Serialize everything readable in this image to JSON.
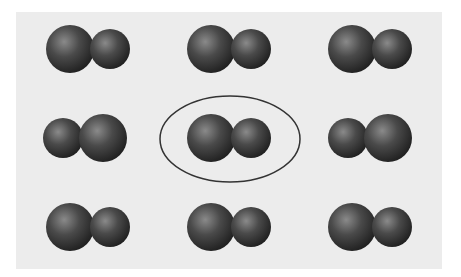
{
  "diagram": {
    "panel": {
      "x": 16,
      "y": 12,
      "width": 426,
      "height": 257,
      "color": "#ececec"
    },
    "sphere_color": "#4a4a4a",
    "highlight_color": "#8a8a8a",
    "shadow_color": "#1e1e1e",
    "ellipse_stroke": "#333333",
    "large_radius": 24,
    "small_radius": 20,
    "molecules": [
      {
        "row": 1,
        "col": 1,
        "order": "large-small",
        "cx": 88,
        "cy": 49
      },
      {
        "row": 1,
        "col": 2,
        "order": "large-small",
        "cx": 229,
        "cy": 49
      },
      {
        "row": 1,
        "col": 3,
        "order": "large-small",
        "cx": 370,
        "cy": 49
      },
      {
        "row": 2,
        "col": 1,
        "order": "small-large",
        "cx": 85,
        "cy": 138
      },
      {
        "row": 2,
        "col": 2,
        "order": "large-small",
        "cx": 229,
        "cy": 138,
        "highlighted": true
      },
      {
        "row": 2,
        "col": 3,
        "order": "small-large",
        "cx": 370,
        "cy": 138
      },
      {
        "row": 3,
        "col": 1,
        "order": "large-small",
        "cx": 88,
        "cy": 227
      },
      {
        "row": 3,
        "col": 2,
        "order": "large-small",
        "cx": 229,
        "cy": 227
      },
      {
        "row": 3,
        "col": 3,
        "order": "large-small",
        "cx": 370,
        "cy": 227
      }
    ],
    "highlight_ellipse": {
      "cx": 230,
      "cy": 139,
      "rx": 70,
      "ry": 43
    }
  }
}
